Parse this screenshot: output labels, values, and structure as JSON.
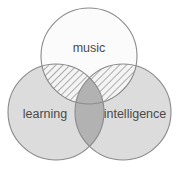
{
  "diagram": {
    "type": "venn",
    "title": "",
    "set_count": 3,
    "sets": [
      {
        "id": "music",
        "label": "music",
        "position": "top",
        "fill_color": "#fbfbfb",
        "stroke_color": "#8a8a8a",
        "cx": 89,
        "cy": 56,
        "r": 48,
        "label_x": 89,
        "label_y": 49
      },
      {
        "id": "learning",
        "label": "learning",
        "position": "bottom-left",
        "fill_color": "#dcdcdc",
        "stroke_color": "#8a8a8a",
        "cx": 56,
        "cy": 112,
        "r": 48,
        "label_x": 45,
        "label_y": 115
      },
      {
        "id": "intelligence",
        "label": "intelligence",
        "position": "bottom-right",
        "fill_color": "#dcdcdc",
        "stroke_color": "#8a8a8a",
        "cx": 123,
        "cy": 112,
        "r": 48,
        "label_x": 135,
        "label_y": 115
      }
    ],
    "intersections": [
      {
        "id": "music-learning",
        "sets": [
          "music",
          "learning"
        ],
        "style": "hatched",
        "hatch_angle_deg": 45,
        "hatch_color": "#6f6f6f",
        "fill_color": "#f2f2f2"
      },
      {
        "id": "music-intelligence",
        "sets": [
          "music",
          "intelligence"
        ],
        "style": "hatched",
        "hatch_angle_deg": 45,
        "hatch_color": "#6f6f6f",
        "fill_color": "#f2f2f2"
      },
      {
        "id": "learning-intelligence",
        "sets": [
          "learning",
          "intelligence"
        ],
        "style": "solid",
        "fill_color": "#b2b2b2"
      },
      {
        "id": "music-learning-intelligence",
        "sets": [
          "music",
          "learning",
          "intelligence"
        ],
        "style": "solid",
        "fill_color": "#b2b2b2"
      }
    ],
    "colors": {
      "background": "#ffffff",
      "outline": "#8a8a8a",
      "label_text": "#4a4a4a",
      "light_fill": "#dcdcdc",
      "near_white_fill": "#fbfbfb",
      "center_fill": "#b2b2b2",
      "hatch_stroke": "#6f6f6f"
    }
  }
}
